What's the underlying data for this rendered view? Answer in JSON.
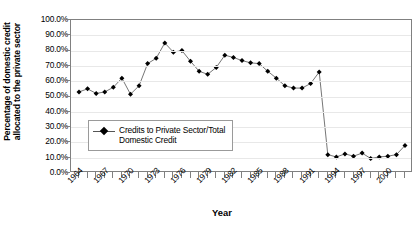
{
  "chart_data": {
    "type": "line",
    "title": "",
    "xlabel": "Year",
    "ylabel": "Percentage of domestic credit allocated to the private sector",
    "ylabel_line1": "Percentage of domestic credit",
    "ylabel_line2": "allocated to the private sector",
    "legend": [
      "Credits to Private Sector/Total Domestic Credit"
    ],
    "legend_position": "inside-left-lower",
    "legend_line1": "Credits to Private Sector/Total",
    "legend_line2": "Domestic Credit",
    "grid": true,
    "ylim": [
      0,
      100
    ],
    "ytick_labels": [
      "100.0%",
      "90.0%",
      "80.0%",
      "70.0%",
      "60.0%",
      "50.0%",
      "40.0%",
      "30.0%",
      "20.0%",
      "10.0%",
      "0.0%"
    ],
    "ytick_values": [
      100,
      90,
      80,
      70,
      60,
      50,
      40,
      30,
      20,
      10,
      0
    ],
    "xlim": [
      1964,
      2002
    ],
    "xtick_labels": [
      "1964",
      "1967",
      "1970",
      "1973",
      "1976",
      "1979",
      "1982",
      "1985",
      "1988",
      "1991",
      "1994",
      "1997",
      "2000"
    ],
    "xtick_values": [
      1964,
      1967,
      1970,
      1973,
      1976,
      1979,
      1982,
      1985,
      1988,
      1991,
      1994,
      1997,
      2000
    ],
    "marker": "diamond",
    "marker_color": "#000000",
    "line_color": "#666666",
    "x": [
      1964,
      1965,
      1966,
      1967,
      1968,
      1969,
      1970,
      1971,
      1972,
      1973,
      1974,
      1975,
      1976,
      1977,
      1978,
      1979,
      1980,
      1981,
      1982,
      1983,
      1984,
      1985,
      1986,
      1987,
      1988,
      1989,
      1990,
      1991,
      1992,
      1993,
      1994,
      1995,
      1996,
      1997,
      1998,
      1999,
      2000,
      2001,
      2002
    ],
    "values": [
      53.0,
      55.0,
      52.0,
      53.0,
      56.0,
      62.0,
      51.5,
      57.0,
      71.5,
      75.0,
      85.0,
      79.0,
      80.0,
      73.0,
      66.5,
      64.5,
      69.0,
      77.0,
      75.5,
      73.5,
      72.0,
      71.5,
      66.5,
      62.0,
      57.0,
      55.5,
      55.5,
      58.5,
      66.0,
      12.0,
      10.5,
      12.5,
      11.0,
      13.0,
      9.5,
      10.5,
      11.0,
      12.0,
      18.0
    ],
    "series": [
      {
        "name": "Credits to Private Sector/Total Domestic Credit",
        "values": [
          53.0,
          55.0,
          52.0,
          53.0,
          56.0,
          62.0,
          51.5,
          57.0,
          71.5,
          75.0,
          85.0,
          79.0,
          80.0,
          73.0,
          66.5,
          64.5,
          69.0,
          77.0,
          75.5,
          73.5,
          72.0,
          71.5,
          66.5,
          62.0,
          57.0,
          55.5,
          55.5,
          58.5,
          66.0,
          12.0,
          10.5,
          12.5,
          11.0,
          13.0,
          9.5,
          10.5,
          11.0,
          12.0,
          18.0
        ]
      }
    ]
  }
}
